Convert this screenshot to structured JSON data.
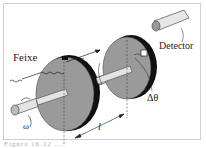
{
  "diagram": {
    "labels": {
      "beam": "Feixe",
      "detector": "Detector",
      "angular_velocity": "ω",
      "angle_offset": "Δθ",
      "distance": "l"
    },
    "caption": "Figura 16.12 ..."
  },
  "colors": {
    "disk": "#9a9a9a",
    "disk_edge": "#111111",
    "shaft": "#e4e4e4",
    "line": "#222222"
  }
}
